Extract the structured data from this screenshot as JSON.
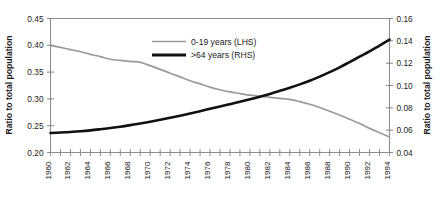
{
  "chart_data": {
    "type": "line",
    "title": "",
    "xlabel": "",
    "ylabel": "Ratio to total population",
    "y2label": "Ratio to total population",
    "grid": false,
    "legend_position": "upper-center-inside",
    "x": [
      1960,
      1961,
      1962,
      1963,
      1964,
      1965,
      1966,
      1967,
      1968,
      1969,
      1970,
      1971,
      1972,
      1973,
      1974,
      1975,
      1976,
      1977,
      1978,
      1979,
      1980,
      1981,
      1982,
      1983,
      1984,
      1985,
      1986,
      1987,
      1988,
      1989,
      1990,
      1991,
      1992,
      1993,
      1994
    ],
    "xlim": [
      1960,
      1994
    ],
    "xticks": [
      1960,
      1962,
      1964,
      1966,
      1968,
      1970,
      1972,
      1974,
      1976,
      1978,
      1980,
      1982,
      1984,
      1986,
      1988,
      1990,
      1992,
      1994
    ],
    "xtick_labels": [
      "1960",
      "1962",
      "1964",
      "1966",
      "1968",
      "1970",
      "1972",
      "1974",
      "1976",
      "1978",
      "1980",
      "1982",
      "1984",
      "1986",
      "1988",
      "1990",
      "1992",
      "1994"
    ],
    "xtick_minor_step": 1,
    "ylim": [
      0.2,
      0.45
    ],
    "yticks": [
      0.2,
      0.25,
      0.3,
      0.35,
      0.4,
      0.45
    ],
    "ytick_labels": [
      "0.20",
      "0.25",
      "0.30",
      "0.35",
      "0.40",
      "0.45"
    ],
    "y2lim": [
      0.04,
      0.16
    ],
    "y2ticks": [
      0.04,
      0.06,
      0.08,
      0.1,
      0.12,
      0.14,
      0.16
    ],
    "y2tick_labels": [
      "0.04",
      "0.06",
      "0.08",
      "0.10",
      "0.12",
      "0.14",
      "0.16"
    ],
    "series": [
      {
        "name": "0-19 years (LHS)",
        "axis": "left",
        "color": "#9a9a9a",
        "width": 1.7,
        "values": [
          0.4,
          0.396,
          0.392,
          0.388,
          0.383,
          0.379,
          0.374,
          0.372,
          0.37,
          0.368,
          0.362,
          0.355,
          0.348,
          0.341,
          0.334,
          0.328,
          0.322,
          0.317,
          0.313,
          0.31,
          0.307,
          0.305,
          0.303,
          0.301,
          0.299,
          0.295,
          0.29,
          0.284,
          0.277,
          0.27,
          0.262,
          0.254,
          0.245,
          0.237,
          0.229
        ]
      },
      {
        "name": ">64 years (RHS)",
        "axis": "right",
        "color": "#111111",
        "width": 2.6,
        "values": [
          0.0575,
          0.0579,
          0.0584,
          0.059,
          0.0598,
          0.0608,
          0.0619,
          0.0631,
          0.0645,
          0.066,
          0.0676,
          0.0693,
          0.0711,
          0.073,
          0.075,
          0.077,
          0.0791,
          0.0812,
          0.0833,
          0.0855,
          0.0877,
          0.09,
          0.0925,
          0.0952,
          0.098,
          0.101,
          0.1043,
          0.108,
          0.112,
          0.1163,
          0.121,
          0.1258,
          0.1305,
          0.1358,
          0.141
        ]
      }
    ]
  },
  "legend": {
    "items": [
      {
        "label": "0-19 years (LHS)",
        "color": "#9a9a9a",
        "style": "thin"
      },
      {
        "label": ">64 years (RHS)",
        "color": "#111111",
        "style": "thick"
      }
    ]
  },
  "axes": {
    "left_title": "Ratio to total population",
    "right_title": "Ratio to total population"
  },
  "colors": {
    "lhs_series": "#9a9a9a",
    "rhs_series": "#111111",
    "axis": "#8d8d8d",
    "text": "#1a1a1a",
    "background": "#ffffff"
  },
  "caption": {
    "text": ""
  }
}
